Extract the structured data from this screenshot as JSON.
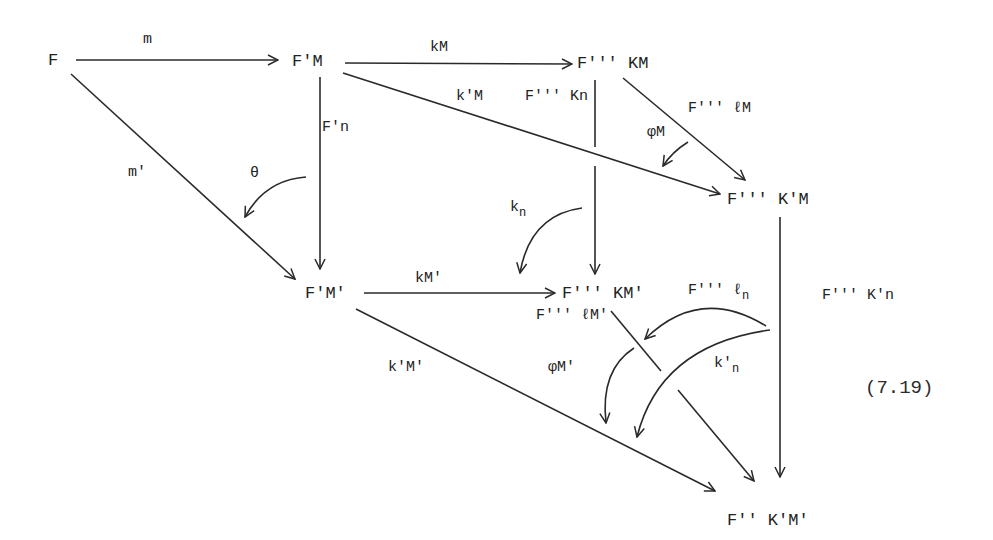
{
  "nodes": {
    "F": "F",
    "FpM": "F'M",
    "F3KM": "F''' KM",
    "F3KpM": "F''' K'M",
    "FpMp": "F'M'",
    "F3KMp": "F''' KM'",
    "F3KpMp": "F'' K'M'"
  },
  "labels": {
    "m": "m",
    "mp": "m'",
    "kM": "kM",
    "kpM": "k'M",
    "F3Kn": "F''' Kn",
    "F3lM": "F''' ℓM",
    "phiM": "φM",
    "Fpn": "F'n",
    "theta": "θ",
    "kn_base": "k",
    "kn_sub": "n",
    "kMp": "kM'",
    "F3KMp_l": "F''' ℓM'",
    "F3ln_base": "F''' ℓ",
    "F3ln_sub": "n",
    "knp_base": "k'",
    "knp_sub": "n",
    "F3Kpn": "F''' K'n",
    "kpMp": "k'M'",
    "phiMp": "φM'"
  },
  "equation_number": "(7.19)"
}
